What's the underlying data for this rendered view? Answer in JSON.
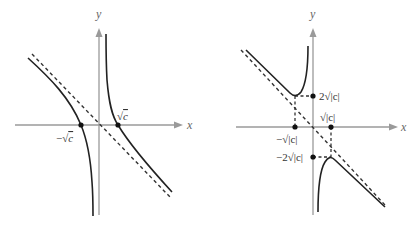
{
  "panels": [
    {
      "id": "left",
      "axis_labels": {
        "x": "x",
        "y": "y"
      },
      "points": [
        {
          "label": "−√c",
          "x_value": "-sqrt(c)",
          "y_value": 0
        },
        {
          "label": "√c",
          "x_value": "sqrt(c)",
          "y_value": 0
        }
      ],
      "labels": {
        "neg_root": "−√",
        "neg_root_rad": "c",
        "pos_root": "√",
        "pos_root_rad": "c"
      },
      "description": "Hyperbola-like graph with two branches crossing the x-axis at ±√c, vertical asymptote x=0, slant asymptote (dashed)"
    },
    {
      "id": "right",
      "axis_labels": {
        "x": "x",
        "y": "y"
      },
      "points": [
        {
          "label": "−√|c|",
          "x_value": "-sqrt(|c|)",
          "y_value": 0
        },
        {
          "label": "√|c|",
          "x_value": "sqrt(|c|)",
          "y_value": 0
        },
        {
          "label": "2√|c|",
          "x_value": 0,
          "y_value": "2sqrt(|c|)"
        },
        {
          "label": "−2√|c|",
          "x_value": 0,
          "y_value": "-2sqrt(|c|)"
        }
      ],
      "labels": {
        "top": "2√|c|",
        "pos_root": "√|c|",
        "neg_root": "−√|c|",
        "bottom": "−2√|c|"
      },
      "description": "Graph with local minimum at (−√|c|, 2√|c|) and local maximum at (√|c|, −2√|c|), vertical asymptote x=0, slant asymptote (dashed)"
    }
  ]
}
